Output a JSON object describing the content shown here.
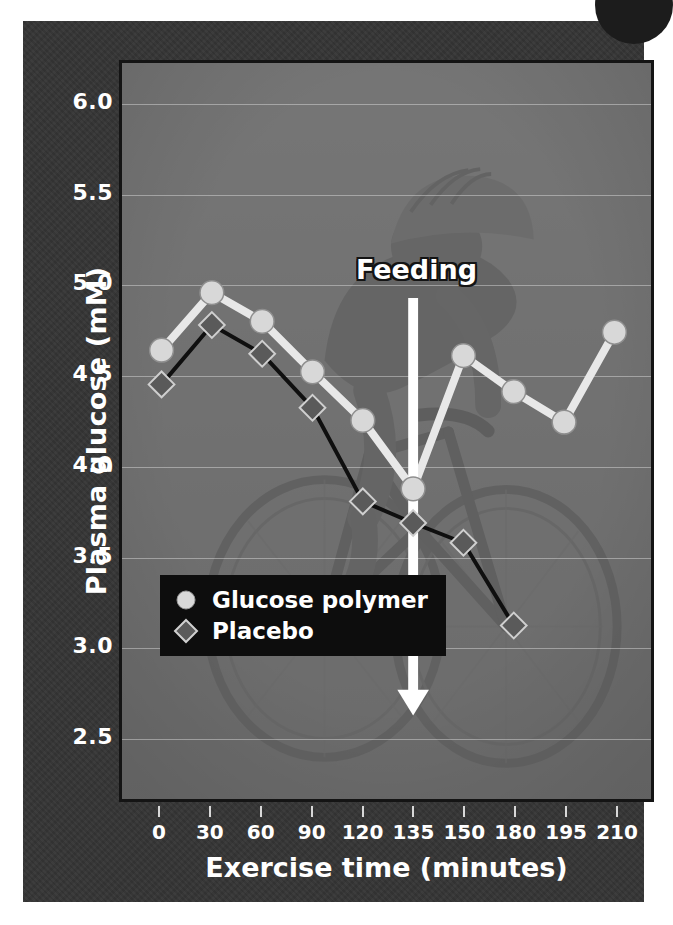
{
  "chart_data": {
    "type": "line",
    "title": "",
    "xlabel": "Exercise time (minutes)",
    "ylabel": "Plasma glucose (mM)",
    "xlim": [
      0,
      210
    ],
    "ylim": [
      2.5,
      6.0
    ],
    "yticks": [
      "6.0",
      "5.5",
      "5.0",
      "4.5",
      "4.0",
      "3.5",
      "3.0",
      "2.5"
    ],
    "ytick_values": [
      6.0,
      5.5,
      5.0,
      4.5,
      4.0,
      3.5,
      3.0,
      2.5
    ],
    "xticks": [
      "0",
      "30",
      "60",
      "90",
      "120",
      "135",
      "150",
      "180",
      "195",
      "210"
    ],
    "xtick_values": [
      0,
      30,
      60,
      90,
      120,
      135,
      150,
      180,
      195,
      210
    ],
    "grid": true,
    "legend_position": "lower-left",
    "series": [
      {
        "name": "Glucose polymer",
        "marker": "circle",
        "color": "#d8d8d8",
        "line_color": "#e8e8e8",
        "x": [
          0,
          30,
          60,
          90,
          120,
          135,
          150,
          180,
          195,
          210
        ],
        "values": [
          4.63,
          4.95,
          4.79,
          4.51,
          4.24,
          3.86,
          4.6,
          4.4,
          4.23,
          4.73
        ]
      },
      {
        "name": "Placebo",
        "marker": "diamond",
        "color": "#5a5a5a",
        "line_color": "#0f0f0f",
        "x": [
          0,
          30,
          60,
          90,
          120,
          135,
          150,
          180
        ],
        "values": [
          4.44,
          4.77,
          4.61,
          4.31,
          3.79,
          3.67,
          3.56,
          3.1
        ]
      }
    ],
    "annotations": [
      {
        "type": "arrow-down",
        "label": "Feeding",
        "x": 135,
        "label_y": 5.05,
        "arrow_top_y": 4.92,
        "arrow_bottom_y": 2.6,
        "color": "#ffffff"
      }
    ]
  },
  "legend": {
    "items": [
      {
        "label": "Glucose polymer",
        "marker": "circle-marker"
      },
      {
        "label": "Placebo",
        "marker": "diamond-marker"
      }
    ]
  },
  "colors": {
    "card_background": "#343434",
    "plot_background": "#6e6e6e",
    "axis_frame": "#141414",
    "gridline": "#ebebeb",
    "text": "#ffffff",
    "legend_background": "#0d0d0d",
    "corner_dot": "#1c1c1c",
    "glucose_polymer_marker": "#d8d8d8",
    "placebo_marker": "#5a5a5a"
  }
}
